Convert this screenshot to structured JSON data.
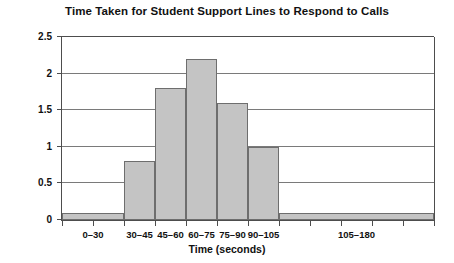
{
  "chart_data": {
    "type": "bar",
    "title": "Time Taken for Student Support Lines to Respond to Calls",
    "xlabel": "Time (seconds)",
    "ylabel": "Frequency of Calls in 000s",
    "categories": [
      "0–30",
      "30–45",
      "45–60",
      "60–75",
      "75–90",
      "90–105",
      "105–180"
    ],
    "values": [
      0.1,
      0.8,
      1.8,
      2.2,
      1.6,
      1.0,
      0.1
    ],
    "bin_edges": [
      0,
      30,
      45,
      60,
      75,
      90,
      105,
      180
    ],
    "ylim": [
      0,
      2.5
    ],
    "xlim": [
      0,
      180
    ],
    "ytick_labels": [
      "0",
      "0.5",
      "1",
      "1.5",
      "2",
      "2.5"
    ],
    "ytick_values": [
      0,
      0.5,
      1,
      1.5,
      2,
      2.5
    ],
    "xtick_values": [
      0,
      15,
      30,
      45,
      60,
      75,
      90,
      105,
      120,
      135,
      150,
      165,
      180
    ],
    "grid": true,
    "legend": "none",
    "bar_color": "#c4c4c4",
    "bar_border_color": "#6e6e6e",
    "axis_color": "#4d4d4d",
    "grid_color": "#7a7a7a",
    "background": "#ffffff"
  }
}
